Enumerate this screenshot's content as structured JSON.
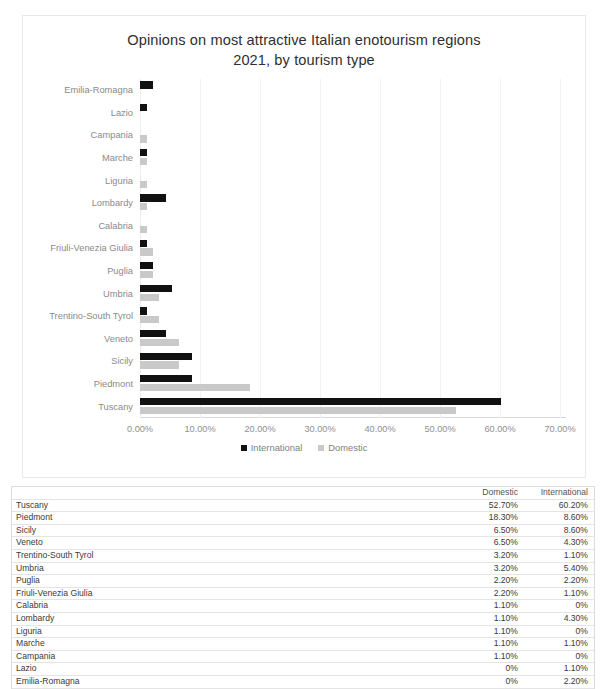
{
  "chart": {
    "title_line1": "Opinions on most attractive Italian enotourism regions",
    "title_line2": "2021, by tourism type"
  },
  "legend": {
    "items": [
      {
        "label": "International",
        "color": "#111111",
        "marker": "square-marker-icon"
      },
      {
        "label": "Domestic",
        "color": "#c9c9c9",
        "marker": "square-marker-icon"
      }
    ]
  },
  "table": {
    "headers": {
      "region": "",
      "domestic": "Domestic",
      "international": "International"
    },
    "rows": [
      {
        "region": "Tuscany",
        "domestic": "52.70%",
        "international": "60.20%"
      },
      {
        "region": "Piedmont",
        "domestic": "18.30%",
        "international": "8.60%"
      },
      {
        "region": "Sicily",
        "domestic": "6.50%",
        "international": "8.60%"
      },
      {
        "region": "Veneto",
        "domestic": "6.50%",
        "international": "4.30%"
      },
      {
        "region": "Trentino-South Tyrol",
        "domestic": "3.20%",
        "international": "1.10%"
      },
      {
        "region": "Umbria",
        "domestic": "3.20%",
        "international": "5.40%"
      },
      {
        "region": "Puglia",
        "domestic": "2.20%",
        "international": "2.20%"
      },
      {
        "region": "Friuli-Venezia Giulia",
        "domestic": "2.20%",
        "international": "1.10%"
      },
      {
        "region": "Calabria",
        "domestic": "1.10%",
        "international": "0%"
      },
      {
        "region": "Lombardy",
        "domestic": "1.10%",
        "international": "4.30%"
      },
      {
        "region": "Liguria",
        "domestic": "1.10%",
        "international": "0%"
      },
      {
        "region": "Marche",
        "domestic": "1.10%",
        "international": "1.10%"
      },
      {
        "region": "Campania",
        "domestic": "1.10%",
        "international": "0%"
      },
      {
        "region": "Lazio",
        "domestic": "0%",
        "international": "1.10%"
      },
      {
        "region": "Emilia-Romagna",
        "domestic": "0%",
        "international": "2.20%"
      }
    ]
  },
  "chart_data": {
    "type": "bar",
    "orientation": "horizontal",
    "title": "Opinions on most attractive Italian enotourism regions 2021, by tourism type",
    "xlabel": "",
    "ylabel": "",
    "xlim": [
      0,
      71
    ],
    "grid": true,
    "legend_position": "bottom-center",
    "xticks": [
      0,
      10,
      20,
      30,
      40,
      50,
      60,
      70
    ],
    "xtick_labels": [
      "0.00%",
      "10.00%",
      "20.00%",
      "30.00%",
      "40.00%",
      "50.00%",
      "60.00%",
      "70.00%"
    ],
    "categories": [
      "Emilia-Romagna",
      "Lazio",
      "Campania",
      "Marche",
      "Liguria",
      "Lombardy",
      "Calabria",
      "Friuli-Venezia Giulia",
      "Puglia",
      "Umbria",
      "Trentino-South Tyrol",
      "Veneto",
      "Sicily",
      "Piedmont",
      "Tuscany"
    ],
    "series": [
      {
        "name": "International",
        "color": "#111111",
        "values": [
          2.2,
          1.1,
          0,
          1.1,
          0,
          4.3,
          0,
          1.1,
          2.2,
          5.4,
          1.1,
          4.3,
          8.6,
          8.6,
          60.2
        ]
      },
      {
        "name": "Domestic",
        "color": "#c9c9c9",
        "values": [
          0,
          0,
          1.1,
          1.1,
          1.1,
          1.1,
          1.1,
          2.2,
          2.2,
          3.2,
          3.2,
          6.5,
          6.5,
          18.3,
          52.7
        ]
      }
    ]
  }
}
